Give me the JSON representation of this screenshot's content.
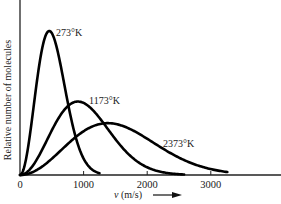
{
  "chart_data": {
    "type": "line",
    "title": "",
    "xlabel": "v (m/s)",
    "xlabel_italic_part": "v",
    "xlabel_rest": " (m/s)",
    "ylabel": "Relative number of molecules",
    "xlim": [
      0,
      4100
    ],
    "ylim": [
      0,
      1
    ],
    "xticks": [
      0,
      1000,
      2000,
      3000
    ],
    "xtick_labels": [
      "0",
      "1000",
      "2000",
      "3000"
    ],
    "yticks": [],
    "grid": false,
    "legend": "inline labels next to curves",
    "series": [
      {
        "name": "273°K",
        "label": "273°K",
        "most_probable_speed": 460,
        "peak_relative_height": 1.0,
        "x_end": 1250
      },
      {
        "name": "1173°K",
        "label": "1173°K",
        "most_probable_speed": 910,
        "peak_relative_height": 0.51,
        "x_end": 2580
      },
      {
        "name": "2373°K",
        "label": "2373°K",
        "most_probable_speed": 1380,
        "peak_relative_height": 0.36,
        "x_end": 3260
      }
    ],
    "annotations": [
      "273°K",
      "1173°K",
      "2373°K"
    ],
    "arrow": "x-axis direction arrow after x label"
  },
  "colors": {
    "background": "#ffffff",
    "line": "#000000",
    "text": "#1a1a1a"
  }
}
